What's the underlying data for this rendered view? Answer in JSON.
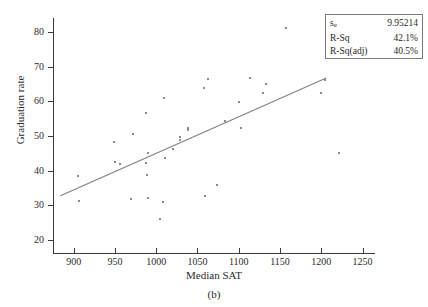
{
  "figure": {
    "caption": "(b)",
    "title_cut_off": ""
  },
  "legend": {
    "rows": [
      {
        "key": "s",
        "key_sub": "e",
        "value": "9.95214"
      },
      {
        "key": "R-Sq",
        "key_sub": "",
        "value": "42.1%"
      },
      {
        "key": "R-Sq(adj)",
        "key_sub": "",
        "value": "40.5%"
      }
    ]
  },
  "chart_data": {
    "type": "scatter",
    "title": "",
    "xlabel": "Median SAT",
    "ylabel": "Graduation rate",
    "xlim": [
      875,
      1265
    ],
    "ylim": [
      16,
      84
    ],
    "xticks": [
      900,
      950,
      1000,
      1050,
      1100,
      1150,
      1200,
      1250
    ],
    "yticks": [
      20,
      30,
      40,
      50,
      60,
      70,
      80
    ],
    "grid": false,
    "legend_position": "top-right",
    "marker_color": "#8a8a8a",
    "line_color": "#808080",
    "points": [
      {
        "x": 905,
        "y": 38.4
      },
      {
        "x": 906,
        "y": 31.3
      },
      {
        "x": 949,
        "y": 48.2
      },
      {
        "x": 950,
        "y": 42.6
      },
      {
        "x": 956,
        "y": 42.0
      },
      {
        "x": 969,
        "y": 31.8
      },
      {
        "x": 972,
        "y": 50.5
      },
      {
        "x": 988,
        "y": 56.6
      },
      {
        "x": 988,
        "y": 42.1
      },
      {
        "x": 989,
        "y": 38.8
      },
      {
        "x": 990,
        "y": 45.1
      },
      {
        "x": 990,
        "y": 32.1
      },
      {
        "x": 1005,
        "y": 26.1
      },
      {
        "x": 1008,
        "y": 31.0
      },
      {
        "x": 1010,
        "y": 61.0
      },
      {
        "x": 1011,
        "y": 43.6
      },
      {
        "x": 1020,
        "y": 46.3
      },
      {
        "x": 1029,
        "y": 49.6
      },
      {
        "x": 1029,
        "y": 48.9
      },
      {
        "x": 1038,
        "y": 52.4
      },
      {
        "x": 1038,
        "y": 51.6
      },
      {
        "x": 1058,
        "y": 63.8
      },
      {
        "x": 1059,
        "y": 32.6
      },
      {
        "x": 1063,
        "y": 66.5
      },
      {
        "x": 1074,
        "y": 36.0
      },
      {
        "x": 1083,
        "y": 54.4
      },
      {
        "x": 1100,
        "y": 59.9
      },
      {
        "x": 1103,
        "y": 52.2
      },
      {
        "x": 1113,
        "y": 66.8
      },
      {
        "x": 1129,
        "y": 62.4
      },
      {
        "x": 1133,
        "y": 64.9
      },
      {
        "x": 1157,
        "y": 81.2
      },
      {
        "x": 1200,
        "y": 62.3
      },
      {
        "x": 1204,
        "y": 66.0
      },
      {
        "x": 1222,
        "y": 45.2
      }
    ],
    "regression_line": {
      "x_start": 884,
      "y_start": 32.8,
      "x_end": 1206,
      "y_end": 66.7
    },
    "statistics": {
      "s_e": 9.95214,
      "r_sq": "42.1%",
      "r_sq_adj": "40.5%"
    }
  }
}
